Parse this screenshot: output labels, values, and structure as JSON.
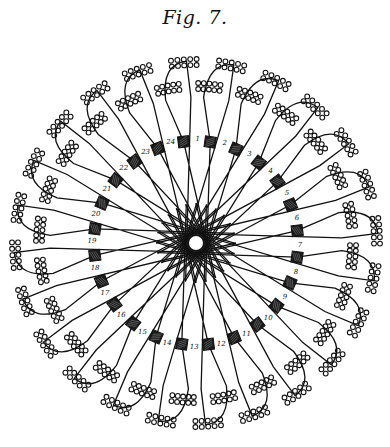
{
  "figure": {
    "title": "Fig. 7.",
    "center": [
      196,
      243
    ],
    "hub_radius": 8,
    "square_ring_radius": 102,
    "coil_ring_inner_radius": 150,
    "coil_ring_outer_radius": 180,
    "slot_count": 24,
    "start_angle_deg": -82,
    "stroke_color": "#111111",
    "background_color": "#ffffff",
    "slots": [
      {
        "label": "1"
      },
      {
        "label": "2"
      },
      {
        "label": "3"
      },
      {
        "label": "4"
      },
      {
        "label": "5"
      },
      {
        "label": "6"
      },
      {
        "label": "7"
      },
      {
        "label": "8"
      },
      {
        "label": "9"
      },
      {
        "label": "10"
      },
      {
        "label": "11"
      },
      {
        "label": "12"
      },
      {
        "label": "13"
      },
      {
        "label": "14"
      },
      {
        "label": "15"
      },
      {
        "label": "16"
      },
      {
        "label": "17"
      },
      {
        "label": "18"
      },
      {
        "label": "19"
      },
      {
        "label": "20"
      },
      {
        "label": "21"
      },
      {
        "label": "22"
      },
      {
        "label": "23"
      },
      {
        "label": "24"
      }
    ]
  }
}
